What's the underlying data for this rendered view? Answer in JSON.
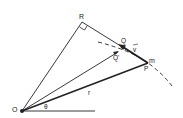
{
  "diagram": {
    "title": "",
    "labels": {
      "R": "R",
      "Q": "Q",
      "Q_prime": "Q'",
      "v": "v",
      "m": "m",
      "P": "P",
      "O": "O",
      "theta": "θ",
      "r": "r"
    },
    "colors": {
      "line": "#222222",
      "background": "#ffffff"
    }
  }
}
